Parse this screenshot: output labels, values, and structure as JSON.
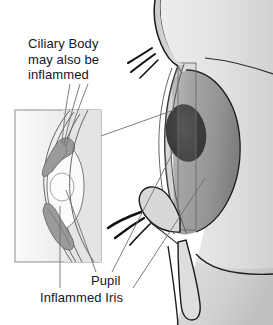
{
  "figure": {
    "background_color": "#ffffff"
  },
  "labels": {
    "ciliary_body": "Ciliary Body\nmay also be\ninflammed",
    "pupil": "Pupil",
    "inflamed_iris": "Inflammed Iris"
  },
  "colors": {
    "text": "#15161a",
    "outline": "#1a1a1a",
    "leader_line": "#6e6e74",
    "inset_border": "#8d8d93",
    "skin_light": "#e8e8e8",
    "skin_mid": "#d6d6d6",
    "skin_shadow": "#bdbdbd",
    "sclera": "#d9d9d9",
    "iris_mid": "#a0a0a0",
    "iris_dark": "#8a8a8a",
    "pupil": "#3b3b3b",
    "inflamed_tissue": "#9a9a9a",
    "lash_black": "#111111",
    "inset_fill": "#f7f7f7",
    "inset_tint": "#e2e2e2"
  },
  "inset": {
    "name": "anterior-segment-cross-section",
    "rect": {
      "x": 15,
      "y": 110,
      "width": 86,
      "height": 152
    }
  },
  "zoom_region": {
    "name": "magnified-region-indicator",
    "rect": {
      "x": 178,
      "y": 63,
      "width": 18,
      "height": 167
    }
  },
  "parts": [
    {
      "name": "face-profile",
      "label": "face profile"
    },
    {
      "name": "upper-eyelid",
      "label": "upper eyelid"
    },
    {
      "name": "lower-eyelid",
      "label": "lower eyelid"
    },
    {
      "name": "upper-eyelashes",
      "label": "upper eyelashes"
    },
    {
      "name": "lower-eyelashes",
      "label": "lower eyelashes"
    },
    {
      "name": "cornea",
      "label": "cornea"
    },
    {
      "name": "iris",
      "label": "iris"
    },
    {
      "name": "pupil",
      "label": "pupil"
    },
    {
      "name": "nose",
      "label": "nose"
    }
  ]
}
